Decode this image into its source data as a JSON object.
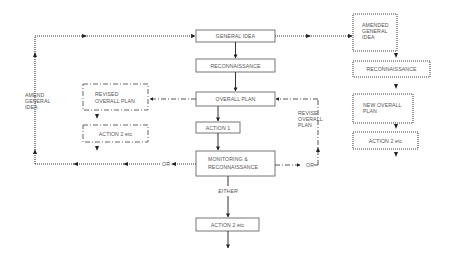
{
  "diagram": {
    "type": "action-research-spiral-flowchart",
    "main_column": {
      "general_idea": "GENERAL IDEA",
      "reconnaissance": "RECONNAISSANCE",
      "overall_plan": "OVERALL PLAN",
      "action1": "ACTION 1",
      "monitoring_line1": "MONITORING &",
      "monitoring_line2": "RECONNAISSANCE",
      "either": "EITHER",
      "action2": "ACTION 2 etc"
    },
    "left_branch": {
      "revised_line1": "REVISED",
      "revised_line2": "OVERALL PLAN",
      "action2": "ACTION 2 etc",
      "or": "OR",
      "amend_line1": "AMEND",
      "amend_line2": "GENERAL",
      "amend_line3": "IDEA"
    },
    "right_loop": {
      "or": "OR",
      "revise_line1": "REVISE",
      "revise_line2": "OVERALL",
      "revise_line3": "PLAN"
    },
    "right_column": {
      "amended_line1": "AMENDED",
      "amended_line2": "GENERAL",
      "amended_line3": "IDEA",
      "reconnaissance": "RECONNAISSANCE",
      "new_plan_line1": "NEW OVERALL",
      "new_plan_line2": "PLAN",
      "action2": "ACTION 2 etc"
    },
    "legend_styles": {
      "solid": "main cycle",
      "dash-dot": "revised overall plan branch",
      "dotted": "amended general idea branch"
    }
  }
}
